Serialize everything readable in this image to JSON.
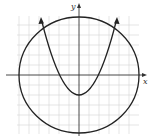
{
  "diagram": {
    "axes": {
      "x_label": "x",
      "y_label": "y"
    },
    "grid": {
      "cell_px": 10,
      "color": "#cfcfcf"
    },
    "curves": [
      {
        "type": "circle",
        "center": [
          0,
          0
        ],
        "radius_units": 6
      },
      {
        "type": "parabola",
        "vertex": [
          0,
          -6
        ],
        "opens": "up",
        "arrows": true
      }
    ],
    "colors": {
      "curve": "#222222",
      "axis": "#333333",
      "grid": "#cfcfcf"
    }
  }
}
